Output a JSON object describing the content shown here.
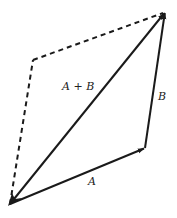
{
  "diagram": {
    "type": "vector-addition-parallelogram",
    "colors": {
      "stroke": "#1a1a1a",
      "text": "#222222",
      "background": "#ffffff"
    },
    "points": {
      "origin": [
        10,
        204
      ],
      "a_tip": [
        145,
        148
      ],
      "sum_tip": [
        165,
        12
      ],
      "dashed_corner": [
        33,
        60
      ]
    },
    "vectors": [
      {
        "id": "A",
        "label": "A",
        "from": "origin",
        "to": "a_tip",
        "style": "solid"
      },
      {
        "id": "B",
        "label": "B",
        "from": "a_tip",
        "to": "sum_tip",
        "style": "solid"
      },
      {
        "id": "A+B",
        "label": "A + B",
        "from": "origin",
        "to": "sum_tip",
        "style": "solid"
      }
    ],
    "dashed_edges": [
      {
        "from": "origin",
        "to": "dashed_corner"
      },
      {
        "from": "dashed_corner",
        "to": "sum_tip"
      }
    ],
    "labels": {
      "a": "A",
      "b": "B",
      "sum": "A + B"
    }
  }
}
